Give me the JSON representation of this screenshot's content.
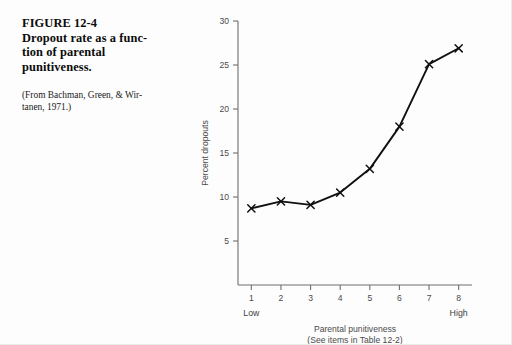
{
  "caption": {
    "title_lines": [
      "FIGURE 12-4",
      "Dropout rate as a func-",
      "tion of parental",
      "punitiveness."
    ],
    "source_lines": [
      "(From Bachman, Green, & Wir-",
      "tanen, 1971.)"
    ]
  },
  "chart_data": {
    "type": "line",
    "title": "",
    "xlabel": "Parental punitiveness",
    "xlabel_sub": "(See items in Table 12-2)",
    "ylabel": "Percent dropouts",
    "x": [
      1,
      2,
      3,
      4,
      5,
      6,
      7,
      8
    ],
    "values": [
      8.7,
      9.5,
      9.1,
      10.5,
      13.2,
      18.0,
      25.1,
      26.9
    ],
    "xticks": [
      "1",
      "2",
      "3",
      "4",
      "5",
      "6",
      "7",
      "8"
    ],
    "yticks": [
      "5",
      "10",
      "15",
      "20",
      "25",
      "30"
    ],
    "ytick_values": [
      5,
      10,
      15,
      20,
      25,
      30
    ],
    "xlim": [
      0.55,
      8.45
    ],
    "ylim": [
      0,
      30
    ],
    "x_low_label": "Low",
    "x_high_label": "High",
    "grid": false,
    "legend": "none",
    "marker": "x",
    "line_color": "#101010",
    "axis_color": "#6f6f6f"
  }
}
